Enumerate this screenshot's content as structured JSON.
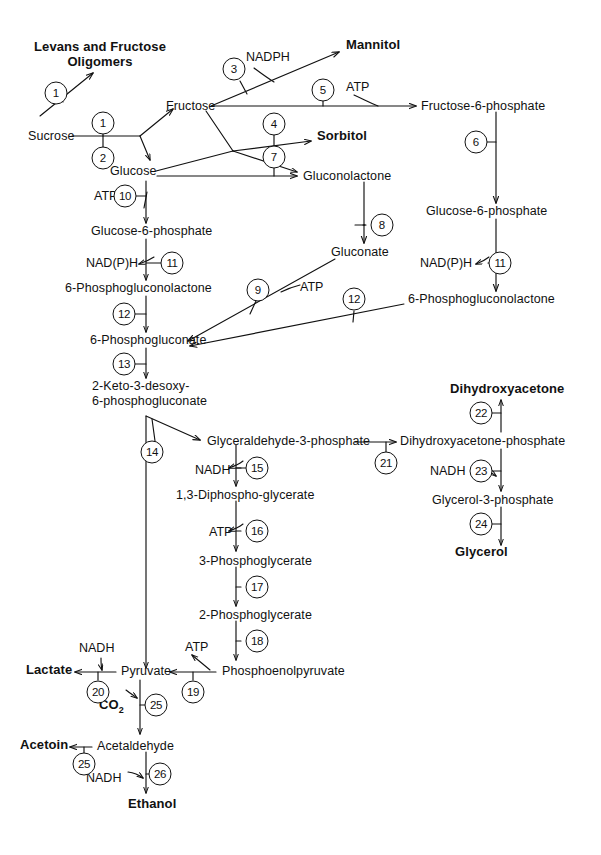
{
  "diagram": {
    "type": "metabolic-pathway"
  },
  "metabolites": [
    {
      "id": "levans",
      "label": "Levans and Fructose\nOligomers",
      "x": 100,
      "y": 46,
      "bold": true,
      "align": "center",
      "lines": 2
    },
    {
      "id": "sucrose",
      "label": "Sucrose",
      "x": 28,
      "y": 131,
      "bold": false,
      "align": "left",
      "lines": 1
    },
    {
      "id": "fructose",
      "label": "Fructose",
      "x": 166,
      "y": 101,
      "bold": false,
      "align": "left",
      "lines": 1
    },
    {
      "id": "glucose",
      "label": "Glucose",
      "x": 110,
      "y": 167,
      "bold": false,
      "align": "left",
      "lines": 1
    },
    {
      "id": "mannitol",
      "label": "Mannitol",
      "x": 346,
      "y": 45,
      "bold": true,
      "align": "left",
      "lines": 1
    },
    {
      "id": "sorbitol",
      "label": "Sorbitol",
      "x": 317,
      "y": 136,
      "bold": true,
      "align": "left",
      "lines": 1
    },
    {
      "id": "gluconolactone",
      "label": "Gluconolactone",
      "x": 303,
      "y": 171,
      "bold": false,
      "align": "left",
      "lines": 1
    },
    {
      "id": "f6p",
      "label": "Fructose-6-phosphate",
      "x": 421,
      "y": 100,
      "bold": false,
      "align": "left",
      "lines": 1
    },
    {
      "id": "g6p_right",
      "label": "Glucose-6-phosphate",
      "x": 426,
      "y": 210,
      "bold": false,
      "align": "left",
      "lines": 1
    },
    {
      "id": "pgl_right",
      "label": "6-Phosphogluconolactone",
      "x": 408,
      "y": 298,
      "bold": false,
      "align": "left",
      "lines": 1
    },
    {
      "id": "gluconate",
      "label": "Gluconate",
      "x": 331,
      "y": 250,
      "bold": false,
      "align": "left",
      "lines": 1
    },
    {
      "id": "g6p_left",
      "label": "Glucose-6-phosphate",
      "x": 91,
      "y": 230,
      "bold": false,
      "align": "left",
      "lines": 1
    },
    {
      "id": "pgl_left",
      "label": "6-Phosphogluconolactone",
      "x": 65,
      "y": 287,
      "bold": false,
      "align": "left",
      "lines": 1
    },
    {
      "id": "pg6",
      "label": "6-Phosphogluconate",
      "x": 90,
      "y": 339,
      "bold": false,
      "align": "left",
      "lines": 1
    },
    {
      "id": "kdpg",
      "label": "2-Keto-3-desoxy-\n6-phosphogluconate",
      "x": 92,
      "y": 385,
      "bold": false,
      "align": "left",
      "lines": 2
    },
    {
      "id": "gap",
      "label": "Glyceraldehyde-3-phosphate",
      "x": 207,
      "y": 437,
      "bold": false,
      "align": "left",
      "lines": 1
    },
    {
      "id": "dhap",
      "label": "Dihydroxyacetone-phosphate",
      "x": 400,
      "y": 437,
      "bold": false,
      "align": "left",
      "lines": 1
    },
    {
      "id": "dha",
      "label": "Dihydroxyacetone",
      "x": 450,
      "y": 389,
      "bold": true,
      "align": "left",
      "lines": 1
    },
    {
      "id": "g3p",
      "label": "Glycerol-3-phosphate",
      "x": 432,
      "y": 498,
      "bold": false,
      "align": "left",
      "lines": 1
    },
    {
      "id": "glycerol",
      "label": "Glycerol",
      "x": 455,
      "y": 551,
      "bold": true,
      "align": "left",
      "lines": 1
    },
    {
      "id": "dpg",
      "label": "1,3-Diphospho-glycerate",
      "x": 176,
      "y": 493,
      "bold": false,
      "align": "left",
      "lines": 1
    },
    {
      "id": "pg3",
      "label": "3-Phosphoglycerate",
      "x": 199,
      "y": 559,
      "bold": false,
      "align": "left",
      "lines": 1
    },
    {
      "id": "pg2",
      "label": "2-Phosphoglycerate",
      "x": 199,
      "y": 613,
      "bold": false,
      "align": "left",
      "lines": 1
    },
    {
      "id": "pep",
      "label": "Phosphoenolpyruvate",
      "x": 222,
      "y": 667,
      "bold": false,
      "align": "left",
      "lines": 1
    },
    {
      "id": "pyruvate",
      "label": "Pyruvate",
      "x": 121,
      "y": 667,
      "bold": false,
      "align": "left",
      "lines": 1
    },
    {
      "id": "lactate",
      "label": "Lactate",
      "x": 26,
      "y": 666,
      "bold": true,
      "align": "left",
      "lines": 1
    },
    {
      "id": "co2",
      "label": "CO2",
      "x": 99,
      "y": 702,
      "bold": true,
      "align": "left",
      "lines": 1,
      "subscript": "2"
    },
    {
      "id": "acetaldehyde",
      "label": "Acetaldehyde",
      "x": 97,
      "y": 742,
      "bold": false,
      "align": "left",
      "lines": 1
    },
    {
      "id": "acetoin",
      "label": "Acetoin",
      "x": 20,
      "y": 741,
      "bold": true,
      "align": "left",
      "lines": 1
    },
    {
      "id": "ethanol",
      "label": "Ethanol",
      "x": 128,
      "y": 800,
      "bold": true,
      "align": "left",
      "lines": 1
    }
  ],
  "cofactors": [
    {
      "id": "nadph-3",
      "label": "NADPH",
      "x": 246,
      "y": 52,
      "align": "left"
    },
    {
      "id": "atp-5",
      "label": "ATP",
      "x": 346,
      "y": 82,
      "align": "left"
    },
    {
      "id": "atp-10",
      "label": "ATP",
      "x": 120,
      "y": 192,
      "align": "left"
    },
    {
      "id": "nadph-11l",
      "label": "NAD(P)H",
      "x": 86,
      "y": 259,
      "align": "left"
    },
    {
      "id": "nadph-11r",
      "label": "NAD(P)H",
      "x": 422,
      "y": 259,
      "align": "left"
    },
    {
      "id": "atp-9",
      "label": "ATP",
      "x": 306,
      "y": 283,
      "align": "left"
    },
    {
      "id": "nadh-15",
      "label": "NADH",
      "x": 204,
      "y": 466,
      "align": "left"
    },
    {
      "id": "nadh-23",
      "label": "NADH",
      "x": 433,
      "y": 468,
      "align": "left"
    },
    {
      "id": "atp-16",
      "label": "ATP",
      "x": 215,
      "y": 528,
      "align": "left"
    },
    {
      "id": "nadh-20",
      "label": "NADH",
      "x": 81,
      "y": 644,
      "align": "left"
    },
    {
      "id": "atp-19",
      "label": "ATP",
      "x": 190,
      "y": 643,
      "align": "left"
    },
    {
      "id": "nadh-26",
      "label": "NADH",
      "x": 87,
      "y": 774,
      "align": "left"
    }
  ],
  "enzymes": [
    {
      "id": "e1a",
      "label": "1",
      "x": 56,
      "y": 93
    },
    {
      "id": "e1b",
      "label": "1",
      "x": 103,
      "y": 123
    },
    {
      "id": "e2",
      "label": "2",
      "x": 103,
      "y": 156
    },
    {
      "id": "e3",
      "label": "3",
      "x": 234,
      "y": 69
    },
    {
      "id": "e4",
      "label": "4",
      "x": 274,
      "y": 124
    },
    {
      "id": "e5",
      "label": "5",
      "x": 323,
      "y": 90
    },
    {
      "id": "e6",
      "label": "6",
      "x": 496,
      "y": 142
    },
    {
      "id": "e7",
      "label": "7",
      "x": 274,
      "y": 156
    },
    {
      "id": "e8",
      "label": "8",
      "x": 374,
      "y": 225
    },
    {
      "id": "e9",
      "label": "9",
      "x": 258,
      "y": 290
    },
    {
      "id": "e10",
      "label": "10",
      "x": 146,
      "y": 196
    },
    {
      "id": "e11l",
      "label": "11",
      "x": 172,
      "y": 263
    },
    {
      "id": "e11r",
      "label": "11",
      "x": 507,
      "y": 263
    },
    {
      "id": "e12l",
      "label": "12",
      "x": 146,
      "y": 314
    },
    {
      "id": "e12r",
      "label": "12",
      "x": 354,
      "y": 299
    },
    {
      "id": "e13",
      "label": "13",
      "x": 146,
      "y": 364
    },
    {
      "id": "e14",
      "label": "14",
      "x": 152,
      "y": 452
    },
    {
      "id": "e15",
      "label": "15",
      "x": 252,
      "y": 468
    },
    {
      "id": "e16",
      "label": "16",
      "x": 252,
      "y": 531
    },
    {
      "id": "e17",
      "label": "17",
      "x": 252,
      "y": 587
    },
    {
      "id": "e18",
      "label": "18",
      "x": 252,
      "y": 641
    },
    {
      "id": "e19",
      "label": "19",
      "x": 193,
      "y": 690
    },
    {
      "id": "e20",
      "label": "20",
      "x": 98,
      "y": 690
    },
    {
      "id": "e21",
      "label": "21",
      "x": 386,
      "y": 461
    },
    {
      "id": "e22",
      "label": "22",
      "x": 501,
      "y": 413
    },
    {
      "id": "e23",
      "label": "23",
      "x": 486,
      "y": 471
    },
    {
      "id": "e24",
      "label": "24",
      "x": 501,
      "y": 524
    },
    {
      "id": "e25a",
      "label": "25",
      "x": 151,
      "y": 705
    },
    {
      "id": "e25b",
      "label": "25",
      "x": 84,
      "y": 764
    },
    {
      "id": "e26",
      "label": "26",
      "x": 155,
      "y": 774
    }
  ],
  "colors": {
    "stroke": "#111111",
    "text": "#111111",
    "background": "#ffffff"
  }
}
